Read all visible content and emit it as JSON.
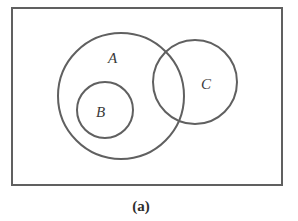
{
  "diagram": {
    "type": "venn",
    "caption": "(a)",
    "stroke_color": "#606060",
    "universe": {
      "x": 12,
      "y": 8,
      "width": 270,
      "height": 177
    },
    "sets": [
      {
        "label": "A",
        "cx": 121,
        "cy": 96,
        "r": 63,
        "label_x": 112,
        "label_y": 63
      },
      {
        "label": "B",
        "cx": 105,
        "cy": 110,
        "r": 28,
        "label_x": 100,
        "label_y": 117
      },
      {
        "label": "C",
        "cx": 195,
        "cy": 82,
        "r": 42,
        "label_x": 203,
        "label_y": 89
      }
    ],
    "relations": [
      "B subset of A",
      "A intersects C",
      "B disjoint from C"
    ]
  }
}
